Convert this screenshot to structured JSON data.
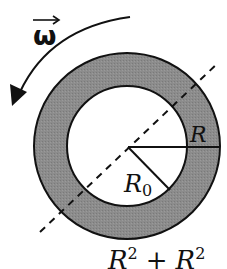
{
  "diagram": {
    "labels": {
      "omega": "ω",
      "outer_radius": "R",
      "inner_radius_base": "R",
      "inner_radius_sub": "0",
      "formula_partial": {
        "term1": "R",
        "term1_sup": "2",
        "operator": "+",
        "term2": "R",
        "term2_sup": "2"
      }
    },
    "colors": {
      "ring_fill": "#8a8a8a",
      "stroke": "#111111",
      "background": "#ffffff"
    },
    "geometry": {
      "center": [
        127,
        146
      ],
      "outer_radius_px": 93,
      "inner_radius_px": 60
    }
  }
}
